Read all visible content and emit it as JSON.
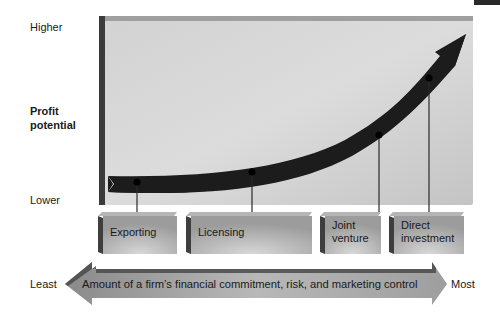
{
  "y_axis": {
    "title_line1": "Profit",
    "title_line2": "potential",
    "high_label": "Higher",
    "low_label": "Lower"
  },
  "x_axis": {
    "arrow_label": "Amount of a firm’s financial commitment, risk, and marketing control",
    "left_label": "Least",
    "right_label": "Most"
  },
  "entry_modes": [
    {
      "line1": "Exporting",
      "line2": "",
      "relative_profit": 0.08
    },
    {
      "line1": "Licensing",
      "line2": "",
      "relative_profit": 0.13
    },
    {
      "line1": "Joint",
      "line2": "venture",
      "relative_profit": 0.33
    },
    {
      "line1": "Direct",
      "line2": "investment",
      "relative_profit": 0.63
    }
  ],
  "colors": {
    "panel": "#c9c9c9",
    "panel_edge": "#3a3a3a",
    "curve": "#1c1c1c",
    "box": "#a9a9a9",
    "arrow": "#9a9a9a"
  }
}
